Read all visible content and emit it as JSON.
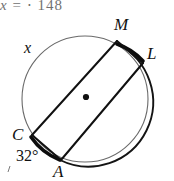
{
  "header": {
    "text_clipped": "x = ⋅ 148",
    "var": "x",
    "equals": "=",
    "dot": "⋅",
    "number": "148"
  },
  "figure": {
    "center_label": "center-dot",
    "circle": {
      "cx": 85,
      "cy": 99,
      "r": 63,
      "stroke": "#555555",
      "bold_stroke": "#111111"
    },
    "points": [
      {
        "id": "M",
        "label": "M",
        "x": 117,
        "y": 39
      },
      {
        "id": "L",
        "label": "L",
        "x": 144,
        "y": 63
      },
      {
        "id": "A",
        "label": "A",
        "x": 60,
        "y": 161
      },
      {
        "id": "C",
        "label": "C",
        "x": 31,
        "y": 133
      }
    ],
    "arc_labels": [
      {
        "id": "x",
        "label": "x",
        "x": 28,
        "y": 48
      }
    ],
    "angle_labels": [
      {
        "id": "angle-32",
        "label": "32°",
        "x": 24,
        "y": 156
      }
    ],
    "bold_arcs": [
      {
        "id": "arc-M-L",
        "from": "M",
        "to": "L"
      },
      {
        "id": "arc-C-A",
        "from": "C",
        "to": "A"
      }
    ],
    "chords": [
      {
        "id": "chord-M-L",
        "from": "M",
        "to": "L"
      },
      {
        "id": "chord-L-A",
        "from": "L",
        "to": "A"
      },
      {
        "id": "chord-A-C",
        "from": "A",
        "to": "C"
      },
      {
        "id": "chord-C-M",
        "from": "C",
        "to": "M"
      }
    ],
    "stray_mark": {
      "id": "stray-tick",
      "x": 9,
      "y": 168
    }
  },
  "colors": {
    "background": "#ffffff",
    "ink": "#111111",
    "light_ink": "#555555",
    "faded_text": "#3a3a3a"
  }
}
